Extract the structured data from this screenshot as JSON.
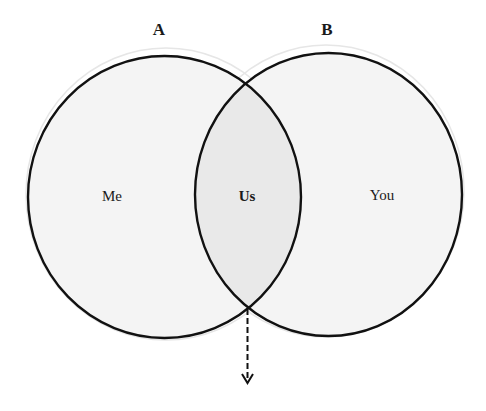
{
  "diagram": {
    "type": "venn",
    "sets": [
      {
        "id": "A",
        "label": "A",
        "region_label": "Me"
      },
      {
        "id": "B",
        "label": "B",
        "region_label": "You"
      }
    ],
    "intersection": {
      "label": "Us"
    },
    "arrow": {
      "style": "dashed",
      "direction": "down",
      "from": "bottom-intersection"
    },
    "colors": {
      "stroke": "#111111",
      "fill": "#f4f4f4",
      "overlap_fill": "#ececec",
      "background": "#ffffff"
    }
  }
}
